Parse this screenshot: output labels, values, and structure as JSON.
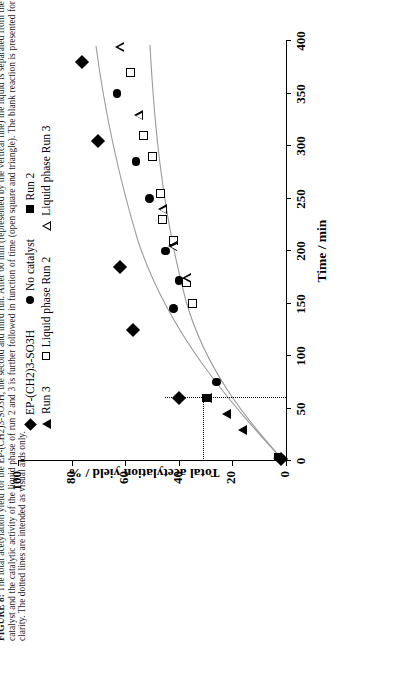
{
  "figure": {
    "label": "FIGURE 8:",
    "caption_text": " The total acetylation yield for the EP-(CH2)3-SO3H, the second and third run. After 60 min (represented by the vertical line) the liquid is separated from the catalyst and the catalytic activity of the liquid phase of run 2 and 3 is further followed in function of time (open square and triangle). The blank reaction is presented for clarity. The dotted lines are intended as visual aids only."
  },
  "chart_data": {
    "type": "scatter",
    "title": "",
    "xlabel": "Time / min",
    "ylabel": "Total acetylation yield /  %",
    "xlim": [
      0,
      400
    ],
    "ylim": [
      0,
      100
    ],
    "xticks": [
      0,
      50,
      100,
      150,
      200,
      250,
      300,
      350,
      400
    ],
    "yticks": [
      0,
      20,
      40,
      60,
      80,
      100
    ],
    "grid": false,
    "legend_position": "top",
    "legend": [
      {
        "label": "EP-(CH2)3-SO3H",
        "marker": "filled-diamond"
      },
      {
        "label": "No catalyst",
        "marker": "filled-circle"
      },
      {
        "label": "Run 2",
        "marker": "filled-square"
      },
      {
        "label": "Run 3",
        "marker": "filled-triangle"
      },
      {
        "label": "Liquid phase Run 2",
        "marker": "open-square"
      },
      {
        "label": "Liquid phase Run 3",
        "marker": "open-triangle"
      }
    ],
    "annotations": [
      {
        "type": "vertical-dotted-line",
        "x": 60,
        "note": "separation of liquid from catalyst at 60 min"
      },
      {
        "type": "horizontal-dotted-line",
        "y": 31,
        "note": "visual aid"
      }
    ],
    "series": [
      {
        "name": "EP-(CH2)3-SO3H",
        "marker": "filled-diamond",
        "points": [
          [
            2,
            2
          ],
          [
            60,
            40
          ],
          [
            125,
            57
          ],
          [
            185,
            62
          ],
          [
            305,
            70
          ],
          [
            380,
            76
          ]
        ]
      },
      {
        "name": "Run 2",
        "marker": "filled-square",
        "points": [
          [
            4,
            3
          ],
          [
            60,
            30
          ]
        ]
      },
      {
        "name": "Run 3",
        "marker": "filled-triangle",
        "points": [
          [
            3,
            3
          ],
          [
            30,
            16
          ],
          [
            45,
            22
          ],
          [
            60,
            29
          ]
        ]
      },
      {
        "name": "No catalyst",
        "marker": "filled-circle",
        "points": [
          [
            3,
            2
          ],
          [
            75,
            26
          ],
          [
            145,
            42
          ],
          [
            172,
            40
          ],
          [
            200,
            45
          ],
          [
            250,
            51
          ],
          [
            285,
            56
          ],
          [
            350,
            63
          ]
        ]
      },
      {
        "name": "Liquid phase Run 2",
        "marker": "open-square",
        "points": [
          [
            150,
            35
          ],
          [
            170,
            37
          ],
          [
            210,
            42
          ],
          [
            230,
            46
          ],
          [
            255,
            47
          ],
          [
            290,
            50
          ],
          [
            310,
            53
          ],
          [
            370,
            58
          ]
        ]
      },
      {
        "name": "Liquid phase Run 3",
        "marker": "open-triangle",
        "points": [
          [
            175,
            37
          ],
          [
            205,
            42
          ],
          [
            240,
            46
          ],
          [
            330,
            55
          ],
          [
            395,
            62
          ]
        ]
      }
    ]
  }
}
